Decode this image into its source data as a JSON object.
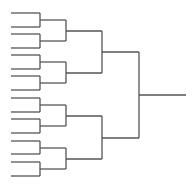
{
  "diagram": {
    "type": "single-elimination-bracket",
    "teams": 16,
    "rounds": 4,
    "line_color": "#555555",
    "background": "#ffffff",
    "leaf_x": [
      11,
      40
    ],
    "round_x": [
      40,
      66,
      102,
      139,
      186
    ],
    "leaf_y": [
      13,
      27,
      34,
      48,
      55,
      69,
      76,
      90,
      98,
      112,
      119,
      133,
      141,
      154,
      162,
      176
    ]
  }
}
